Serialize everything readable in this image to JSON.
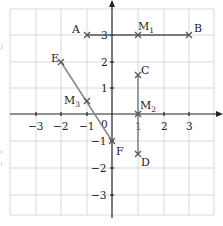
{
  "diagram": {
    "type": "coordinate-plane",
    "x_axis": {
      "ticks": [
        -3,
        -2,
        -1,
        1,
        2,
        3
      ],
      "tick_labels": [
        "−3",
        "−2",
        "−1",
        "1",
        "2",
        "3"
      ],
      "origin_label": "0"
    },
    "y_axis": {
      "ticks": [
        -3,
        -2,
        -1,
        1,
        2,
        3
      ],
      "tick_labels": [
        "−3",
        "−2",
        "−1",
        "1",
        "2",
        "3"
      ],
      "label": "y"
    },
    "points": [
      {
        "name": "A",
        "x": -1,
        "y": 3
      },
      {
        "name": "M",
        "sub": "1",
        "x": 1,
        "y": 3
      },
      {
        "name": "B",
        "x": 3,
        "y": 3
      },
      {
        "name": "C",
        "x": 1,
        "y": 1.5
      },
      {
        "name": "M",
        "sub": "2",
        "x": 1,
        "y": 0
      },
      {
        "name": "D",
        "x": 1,
        "y": -1.5
      },
      {
        "name": "E",
        "x": -2,
        "y": 2
      },
      {
        "name": "M",
        "sub": "3",
        "x": -1,
        "y": 0.5
      },
      {
        "name": "F",
        "x": 0,
        "y": -1
      }
    ],
    "segments": [
      {
        "from": "A",
        "to": "B",
        "color": "#555555"
      },
      {
        "from": "C",
        "to": "D",
        "color": "#888888"
      },
      {
        "from": "E",
        "to": "F",
        "color": "#888888"
      }
    ],
    "colors": {
      "grid": "#d6d6d6",
      "axis": "#222222",
      "point": "#555555"
    }
  }
}
